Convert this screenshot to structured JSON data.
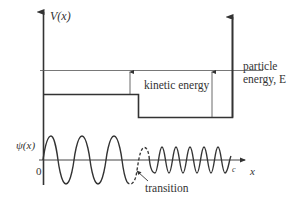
{
  "diagram": {
    "type": "potential-step-wavefunction",
    "colors": {
      "ink": "#333333",
      "thin_line": "#555555",
      "background": "#ffffff"
    },
    "top_panel": {
      "axis_label": "V(x)",
      "energy_label_line1": "particle",
      "energy_label_line2": "energy, E",
      "kinetic_label": "kinetic energy"
    },
    "bottom_panel": {
      "axis_label": "ψ(x)",
      "origin_label": "0",
      "x_axis_label": "x",
      "end_label": "c",
      "transition_label": "transition"
    }
  }
}
